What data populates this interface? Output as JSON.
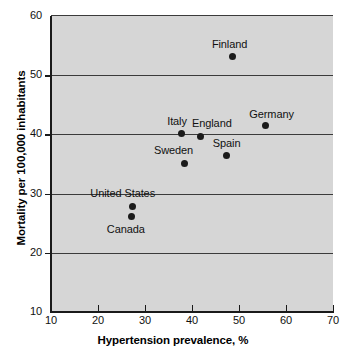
{
  "chart_data": {
    "type": "scatter",
    "title": "",
    "xlabel": "Hypertension prevalence, %",
    "ylabel": "Mortality per 100,000 inhabitants",
    "xlim": [
      10,
      70
    ],
    "ylim": [
      10,
      60
    ],
    "xticks": [
      10,
      20,
      30,
      40,
      50,
      60,
      70
    ],
    "yticks": [
      10,
      20,
      30,
      40,
      50,
      60
    ],
    "grid": "horizontal",
    "legend": "none",
    "colors": {
      "plot_background": "#d6d6d6",
      "page_background": "#ffffff",
      "marker": "#1b1b1b",
      "gridline": "#3b3b3b",
      "axis": "#1a1a1a"
    },
    "points": [
      {
        "label": "Finland",
        "x": 48.7,
        "y": 53.2,
        "label_dx": -21,
        "label_dy": -18
      },
      {
        "label": "Germany",
        "x": 55.6,
        "y": 41.5,
        "label_dx": -16,
        "label_dy": -18
      },
      {
        "label": "England",
        "x": 41.7,
        "y": 39.7,
        "label_dx": -8,
        "label_dy": -19
      },
      {
        "label": "Italy",
        "x": 37.7,
        "y": 40.1,
        "label_dx": -14,
        "label_dy": -19
      },
      {
        "label": "Spain",
        "x": 47.4,
        "y": 36.4,
        "label_dx": -14,
        "label_dy": -19
      },
      {
        "label": "Sweden",
        "x": 38.5,
        "y": 35.1,
        "label_dx": -31,
        "label_dy": -19
      },
      {
        "label": "United States",
        "x": 27.3,
        "y": 27.9,
        "label_dx": -42,
        "label_dy": -19
      },
      {
        "label": "Canada",
        "x": 27.2,
        "y": 26.2,
        "label_dx": -25,
        "label_dy": 7
      }
    ]
  }
}
